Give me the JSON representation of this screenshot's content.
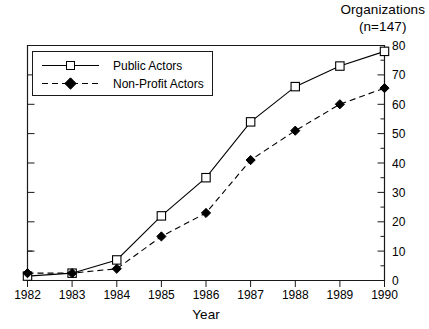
{
  "header": {
    "title": "Organizations",
    "subtitle": "(n=147)"
  },
  "chart_data": {
    "type": "line",
    "title": "Organizations",
    "subtitle": "(n=147)",
    "xlabel": "Year",
    "ylabel": "",
    "categories": [
      "1982",
      "1983",
      "1984",
      "1985",
      "1986",
      "1987",
      "1988",
      "1989",
      "1990"
    ],
    "x": [
      1982,
      1983,
      1984,
      1985,
      1986,
      1987,
      1988,
      1989,
      1990
    ],
    "xlim": [
      1982,
      1990
    ],
    "ylim": [
      0,
      80
    ],
    "y_ticks": [
      0,
      10,
      20,
      30,
      40,
      50,
      60,
      70,
      80
    ],
    "y_minor_tick_step": 5,
    "y_axis_position": "right",
    "grid": false,
    "legend_position": "top-left",
    "series": [
      {
        "name": "Public Actors",
        "marker": "open-square",
        "line_style": "solid",
        "color": "#000000",
        "values": [
          1.5,
          2.5,
          7,
          22,
          35,
          54,
          66,
          73,
          78
        ]
      },
      {
        "name": "Non-Profit Actors",
        "marker": "filled-diamond",
        "line_style": "dashed",
        "color": "#000000",
        "values": [
          2.5,
          2.5,
          4,
          15,
          23,
          41,
          51,
          60,
          65.5
        ]
      }
    ]
  },
  "legend": {
    "items": [
      {
        "label": "Public Actors"
      },
      {
        "label": "Non-Profit Actors"
      }
    ]
  },
  "axes": {
    "x_tick_labels": [
      "1982",
      "1983",
      "1984",
      "1985",
      "1986",
      "1987",
      "1988",
      "1989",
      "1990"
    ],
    "y_tick_labels": [
      "0",
      "10",
      "20",
      "30",
      "40",
      "50",
      "60",
      "70",
      "80"
    ],
    "x_title": "Year"
  }
}
